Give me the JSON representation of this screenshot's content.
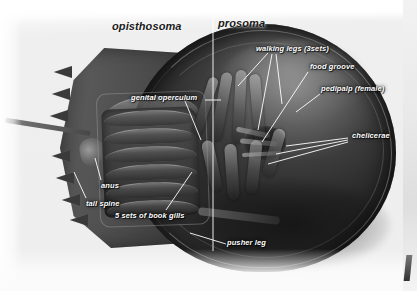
{
  "figure": {
    "background_color": "#fdfdfd",
    "label_color": "#ffffff",
    "divider_color": "#ffffff"
  },
  "regions": [
    {
      "id": "opisthosoma",
      "label": "opisthosoma",
      "x": 112,
      "y": 20
    },
    {
      "id": "prosoma",
      "label": "prosoma",
      "x": 218,
      "y": 17
    }
  ],
  "parts": [
    {
      "id": "walking-legs",
      "label": "walking legs (3sets)",
      "x": 256,
      "y": 47
    },
    {
      "id": "food-groove",
      "label": "food groove",
      "x": 310,
      "y": 65
    },
    {
      "id": "pedipalp",
      "label": "pedipalp (female)",
      "x": 323,
      "y": 87
    },
    {
      "id": "chelicerae",
      "label": "chelicerae",
      "x": 352,
      "y": 133
    },
    {
      "id": "genital-operculum",
      "label": "genital operculum",
      "x": 134,
      "y": 94
    },
    {
      "id": "anus",
      "label": "anus",
      "x": 103,
      "y": 183
    },
    {
      "id": "tail-spine",
      "label": "tail spine",
      "x": 88,
      "y": 202
    },
    {
      "id": "book-gills",
      "label": "5 sets of book gills",
      "x": 118,
      "y": 214
    },
    {
      "id": "pusher-leg",
      "label": "pusher leg",
      "x": 228,
      "y": 241
    }
  ],
  "divider": {
    "label": "prosoma-opisthosoma boundary line",
    "x": 213,
    "y_top": 17,
    "y_bottom": 251
  }
}
